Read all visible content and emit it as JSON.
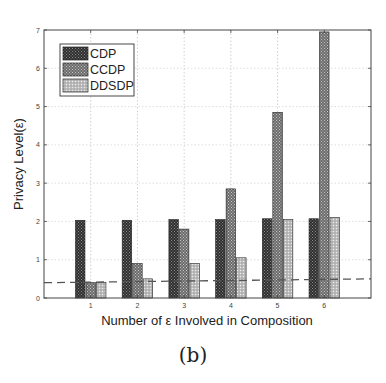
{
  "chart_data": {
    "type": "bar",
    "title": "",
    "xlabel": "Number of ε Involved in Composition",
    "ylabel": "Privacy Level(ε)",
    "categories": [
      "1",
      "2",
      "3",
      "4",
      "5",
      "6"
    ],
    "series": [
      {
        "name": "CDP",
        "values": [
          2.03,
          2.03,
          2.05,
          2.05,
          2.07,
          2.07
        ],
        "color": "#3a3a3a"
      },
      {
        "name": "CCDP",
        "values": [
          0.4,
          0.9,
          1.8,
          2.85,
          4.85,
          6.95
        ],
        "color": "#7a7a7a"
      },
      {
        "name": "DDSDP",
        "values": [
          0.4,
          0.5,
          0.9,
          1.05,
          2.05,
          2.1
        ],
        "color": "#b8b8b8"
      }
    ],
    "reference_line": {
      "style": "dashed",
      "y_start": 0.4,
      "y_end": 0.5,
      "color": "#555555"
    },
    "ylim": [
      0,
      7
    ],
    "xlim": [
      0,
      7
    ],
    "yticks": [
      "0",
      "1",
      "2",
      "3",
      "4",
      "5",
      "6",
      "7"
    ],
    "grid": true,
    "legend_position": "upper left"
  },
  "caption": "(b)"
}
